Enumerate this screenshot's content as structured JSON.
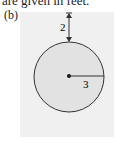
{
  "caption": "are given in feet.",
  "figure": {
    "label": "(b)",
    "gap_label": "2",
    "radius_label": "3",
    "colors": {
      "panel": "#f0f0f0",
      "circle_fill": "#e2e2e2",
      "stroke": "#333333"
    }
  }
}
